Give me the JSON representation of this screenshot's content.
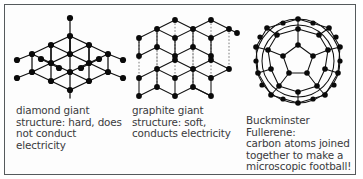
{
  "figure": {
    "name": "carbon-allotropes-diagram",
    "background_color": "#ffffff",
    "frame_color": "#555a5c",
    "text_color": "#3a3a3c",
    "atom_color": "#0a0a0a",
    "bond_color": "#101010",
    "interlayer_bond_color": "#6d6d6d"
  },
  "panels": [
    {
      "id": "diamond",
      "diagram_name": "diamond-lattice-diagram",
      "caption": "diamond giant\nstructure: hard, does\nnot conduct electricity"
    },
    {
      "id": "graphite",
      "diagram_name": "graphite-layers-diagram",
      "caption": "graphite giant\nstructure: soft,\nconducts electricity"
    },
    {
      "id": "fullerene",
      "diagram_name": "buckminsterfullerene-diagram",
      "caption": "Buckminster Fullerene:\ncarbon atoms joined\ntogether to make a\nmicroscopic football!"
    }
  ]
}
